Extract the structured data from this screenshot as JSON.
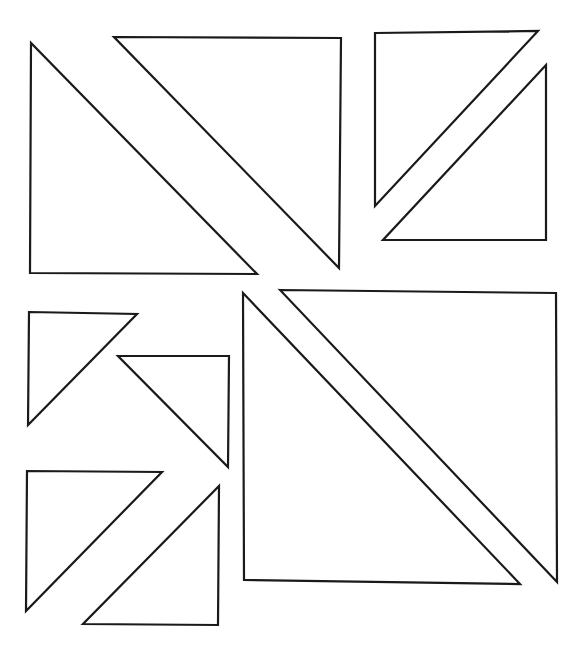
{
  "diagram": {
    "width": 586,
    "height": 657,
    "background": "#ffffff",
    "stroke_color": "#1a1a1a",
    "shapes": [
      {
        "type": "right-triangle",
        "group": "top-left-square",
        "points": [
          [
            31,
            43
          ],
          [
            30,
            273
          ],
          [
            257,
            274
          ]
        ]
      },
      {
        "type": "right-triangle",
        "group": "top-left-square",
        "points": [
          [
            114,
            37
          ],
          [
            341,
            38
          ],
          [
            339,
            268
          ]
        ]
      },
      {
        "type": "right-triangle",
        "group": "top-right-square",
        "points": [
          [
            375,
            33
          ],
          [
            538,
            31
          ],
          [
            375,
            206
          ]
        ]
      },
      {
        "type": "right-triangle",
        "group": "top-right-square",
        "points": [
          [
            546,
            65
          ],
          [
            546,
            240
          ],
          [
            383,
            240
          ]
        ]
      },
      {
        "type": "right-triangle",
        "group": "small-left-upper",
        "points": [
          [
            29,
            312
          ],
          [
            137,
            314
          ],
          [
            28,
            425
          ]
        ]
      },
      {
        "type": "right-triangle",
        "group": "small-left-upper",
        "points": [
          [
            118,
            356
          ],
          [
            229,
            356
          ],
          [
            228,
            467
          ]
        ]
      },
      {
        "type": "right-triangle",
        "group": "small-left-lower",
        "points": [
          [
            27,
            471
          ],
          [
            162,
            472
          ],
          [
            26,
            611
          ]
        ]
      },
      {
        "type": "right-triangle",
        "group": "small-left-lower",
        "points": [
          [
            219,
            486
          ],
          [
            218,
            625
          ],
          [
            83,
            624
          ]
        ]
      },
      {
        "type": "right-triangle",
        "group": "large-bottom-right-square",
        "points": [
          [
            243,
            293
          ],
          [
            244,
            580
          ],
          [
            520,
            584
          ]
        ]
      },
      {
        "type": "right-triangle",
        "group": "large-bottom-right-square",
        "points": [
          [
            280,
            290
          ],
          [
            556,
            293
          ],
          [
            557,
            582
          ]
        ]
      }
    ]
  }
}
